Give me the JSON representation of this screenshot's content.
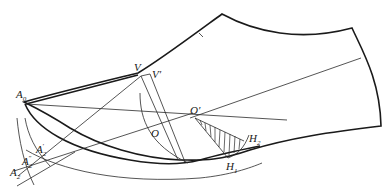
{
  "diagram": {
    "type": "shoe-upper pattern drafting construction",
    "colors": {
      "line": "#1a1a1a",
      "background": "#ffffff"
    },
    "labels": {
      "A0": {
        "base": "A",
        "sub": "0"
      },
      "V": {
        "base": "V",
        "sub": ""
      },
      "Vp": {
        "base": "V′",
        "sub": ""
      },
      "O": {
        "base": "O",
        "sub": ""
      },
      "Op": {
        "base": "O′",
        "sub": ""
      },
      "H1": {
        "base": "H",
        "sub": "1"
      },
      "H2": {
        "base": "H",
        "sub": "2"
      },
      "A2p": {
        "base": "A",
        "sub": "2",
        "sup": "′"
      },
      "A2pp": {
        "base": "A",
        "sub": "2",
        "sup": "″"
      },
      "A2": {
        "base": "A",
        "sub": "2"
      }
    }
  }
}
